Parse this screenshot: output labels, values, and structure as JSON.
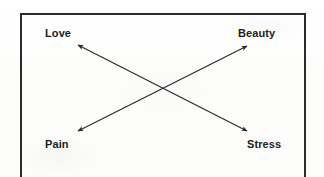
{
  "figure": {
    "background_color": "#fdfdfc",
    "ink_color": "#2b2b2b",
    "frame": {
      "style": "rectangle-open-bottom",
      "stroke_width": 2
    },
    "nodes": [
      {
        "id": "love",
        "label": "Love",
        "corner": "top-left"
      },
      {
        "id": "beauty",
        "label": "Beauty",
        "corner": "top-right"
      },
      {
        "id": "pain",
        "label": "Pain",
        "corner": "bottom-left"
      },
      {
        "id": "stress",
        "label": "Stress",
        "corner": "bottom-right"
      }
    ],
    "connectors": [
      {
        "id": "pain-beauty",
        "from": "pain",
        "to": "beauty",
        "arrowheads": "both",
        "direction": "bottom-left-to-top-right"
      },
      {
        "id": "love-stress",
        "from": "love",
        "to": "stress",
        "arrowheads": "both",
        "direction": "top-left-to-bottom-right"
      }
    ]
  }
}
